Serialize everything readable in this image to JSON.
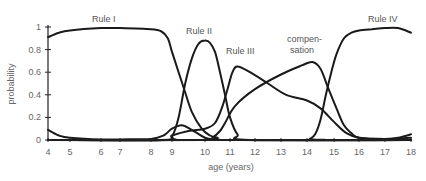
{
  "chart_data": {
    "type": "line",
    "title": "",
    "xlabel": "age (years)",
    "ylabel": "probability",
    "xlim": [
      4,
      18
    ],
    "ylim": [
      0,
      1
    ],
    "x_ticks": [
      4,
      5,
      6,
      7,
      8,
      9,
      10,
      11,
      12,
      13,
      14,
      15,
      16,
      17,
      18
    ],
    "y_ticks": [
      0,
      0.2,
      0.4,
      0.6,
      0.8,
      1
    ],
    "y_tick_labels": [
      "0",
      "0.2",
      "0.4",
      "0.6",
      "0.8",
      "1"
    ],
    "grid": false,
    "legend": "inline labels near curves",
    "series": [
      {
        "name": "Rule I",
        "x": [
          4,
          4.5,
          5,
          6,
          7,
          8,
          8.5,
          8.8,
          9.0,
          9.2,
          9.4,
          9.6,
          9.9,
          10.2,
          10.5,
          11,
          18
        ],
        "values": [
          0.91,
          0.95,
          0.97,
          0.99,
          0.99,
          0.98,
          0.96,
          0.9,
          0.78,
          0.6,
          0.42,
          0.25,
          0.1,
          0.04,
          0.02,
          0.0,
          0.0
        ]
      },
      {
        "name": "Rule I (low probability curve)",
        "x": [
          4,
          4.5,
          5,
          6,
          7,
          8,
          8.6,
          9.0,
          9.3,
          9.6,
          10.0,
          10.4,
          11,
          18
        ],
        "values": [
          0.09,
          0.04,
          0.02,
          0.005,
          0.005,
          0.01,
          0.04,
          0.1,
          0.13,
          0.09,
          0.02,
          0.005,
          0.0,
          0.0
        ]
      },
      {
        "name": "Rule II",
        "x": [
          4,
          8.7,
          9.0,
          9.2,
          9.4,
          9.6,
          9.8,
          10.0,
          10.2,
          10.4,
          10.6,
          10.8,
          11.0,
          11.3,
          11.8,
          18
        ],
        "values": [
          0.0,
          0.0,
          0.03,
          0.2,
          0.5,
          0.72,
          0.85,
          0.88,
          0.86,
          0.78,
          0.6,
          0.4,
          0.2,
          0.05,
          0.0,
          0.0
        ]
      },
      {
        "name": "Rule III",
        "x": [
          4,
          8.5,
          9.0,
          9.5,
          10.0,
          10.4,
          10.7,
          10.9,
          11.1,
          11.3,
          11.8,
          12.5,
          13.2,
          14.0,
          14.5,
          15.0,
          15.5,
          16.0,
          17.0,
          17.5,
          18.0
        ],
        "values": [
          0.0,
          0.0,
          0.04,
          0.08,
          0.1,
          0.15,
          0.3,
          0.45,
          0.6,
          0.65,
          0.6,
          0.5,
          0.4,
          0.35,
          0.28,
          0.16,
          0.06,
          0.02,
          0.01,
          0.02,
          0.05
        ]
      },
      {
        "name": "compensation",
        "x": [
          4,
          10.0,
          10.3,
          10.6,
          10.8,
          11.2,
          12.0,
          13.0,
          13.8,
          14.2,
          14.5,
          14.8,
          15.1,
          15.4,
          15.7,
          16.0,
          17.0,
          18.0
        ],
        "values": [
          0.0,
          0.0,
          0.02,
          0.08,
          0.15,
          0.3,
          0.45,
          0.58,
          0.66,
          0.69,
          0.63,
          0.45,
          0.28,
          0.13,
          0.06,
          0.02,
          0.01,
          0.02
        ]
      },
      {
        "name": "Rule IV",
        "x": [
          4,
          13.9,
          14.1,
          14.3,
          14.5,
          14.7,
          14.9,
          15.1,
          15.4,
          15.7,
          16.0,
          16.5,
          17.0,
          17.5,
          18.0
        ],
        "values": [
          0.0,
          0.0,
          0.01,
          0.05,
          0.18,
          0.4,
          0.6,
          0.76,
          0.9,
          0.95,
          0.97,
          0.98,
          0.99,
          0.99,
          0.95
        ]
      }
    ],
    "annotations": [
      {
        "text": "Rule  I",
        "near_x": 7.0,
        "near_y": 1.08
      },
      {
        "text": "Rule II",
        "near_x": 10.0,
        "near_y": 1.0
      },
      {
        "text": "Rule III",
        "near_x": 11.5,
        "near_y": 0.82
      },
      {
        "text": "compen-\nsation",
        "near_x": 13.8,
        "near_y": 0.88
      },
      {
        "text": "Rule IV",
        "near_x": 17.0,
        "near_y": 1.08
      }
    ]
  },
  "labels": {
    "rule_1": "Rule  I",
    "rule_2": "Rule II",
    "rule_3": "Rule III",
    "compensation_line1": "compen-",
    "compensation_line2": "sation",
    "rule_4": "Rule IV",
    "xlabel": "age (years)",
    "ylabel": "probability"
  },
  "style": {
    "line_color": "#1a1a1a",
    "text_color": "#666666",
    "background": "#ffffff"
  }
}
